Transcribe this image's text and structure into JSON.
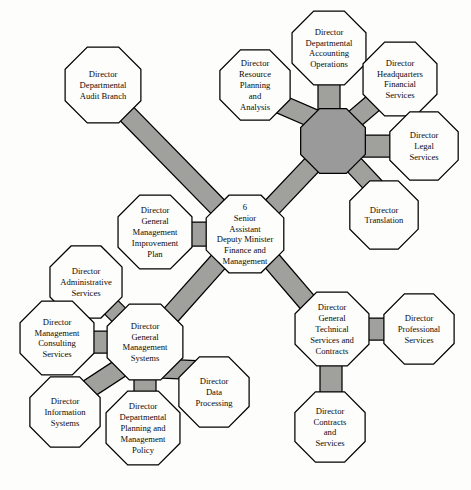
{
  "diagram": {
    "type": "organization-chart",
    "colors": {
      "node_fill": "#fdfdfb",
      "connector_fill": "#a0a09c",
      "hub_fill": "#9a9a9a",
      "outline": "#000000",
      "text": "#0b0b0b",
      "background": "#fdfdfc"
    },
    "nodes": [
      {
        "id": "center",
        "shape": "octagon",
        "filled": false,
        "number": "6",
        "lines": [
          "6",
          "Senior",
          "Assistant",
          "Deputy Minister",
          "Finance and",
          "Management"
        ],
        "cx": 245,
        "cy": 234,
        "r": 42,
        "font_size": 8.6
      },
      {
        "id": "audit-branch",
        "shape": "octagon",
        "filled": false,
        "lines": [
          "Director",
          "Departmental",
          "Audit Branch"
        ],
        "cx": 103,
        "cy": 85,
        "r": 41,
        "font_size": 8.6
      },
      {
        "id": "accounting-hub",
        "shape": "octagon",
        "filled": true,
        "lines": [],
        "cx": 333,
        "cy": 141,
        "r": 35,
        "font_size": 8.6
      },
      {
        "id": "resource-planning",
        "shape": "octagon",
        "filled": false,
        "lines": [
          "Director",
          "Resource",
          "Planning",
          "and",
          "Analysis"
        ],
        "cx": 255,
        "cy": 85,
        "r": 38,
        "font_size": 8.6
      },
      {
        "id": "accounting-operations",
        "shape": "octagon",
        "filled": false,
        "lines": [
          "Director",
          "Departmental",
          "Accounting",
          "Operations"
        ],
        "cx": 329,
        "cy": 48,
        "r": 40,
        "font_size": 8.6
      },
      {
        "id": "headquarters-financial",
        "shape": "octagon",
        "filled": false,
        "lines": [
          "Director",
          "Headquarters",
          "Financial",
          "Services"
        ],
        "cx": 400,
        "cy": 79,
        "r": 40,
        "font_size": 8.6
      },
      {
        "id": "legal-services",
        "shape": "octagon",
        "filled": false,
        "lines": [
          "Director",
          "Legal",
          "Services"
        ],
        "cx": 424,
        "cy": 146,
        "r": 37,
        "font_size": 8.6
      },
      {
        "id": "translation",
        "shape": "octagon",
        "filled": false,
        "lines": [
          "Director",
          "Translation"
        ],
        "cx": 384,
        "cy": 215,
        "r": 37,
        "font_size": 8.6
      },
      {
        "id": "gm-improvement-plan",
        "shape": "octagon",
        "filled": false,
        "lines": [
          "Director",
          "General",
          "Management",
          "Improvement",
          "Plan"
        ],
        "cx": 155,
        "cy": 232,
        "r": 40,
        "font_size": 8.6
      },
      {
        "id": "administrative-services",
        "shape": "octagon",
        "filled": false,
        "lines": [
          "Director",
          "Administrative",
          "Services"
        ],
        "cx": 86,
        "cy": 282,
        "r": 39,
        "font_size": 8.6
      },
      {
        "id": "management-consulting",
        "shape": "octagon",
        "filled": false,
        "lines": [
          "Director",
          "Management",
          "Consulting",
          "Services"
        ],
        "cx": 57,
        "cy": 338,
        "r": 40,
        "font_size": 8.6
      },
      {
        "id": "gm-systems-hub",
        "shape": "octagon",
        "filled": false,
        "lines": [
          "Director",
          "General",
          "Management",
          "Systems"
        ],
        "cx": 145,
        "cy": 342,
        "r": 41,
        "font_size": 8.6
      },
      {
        "id": "information-systems",
        "shape": "octagon",
        "filled": false,
        "lines": [
          "Director",
          "Information",
          "Systems"
        ],
        "cx": 65,
        "cy": 412,
        "r": 38,
        "font_size": 8.6
      },
      {
        "id": "departmental-planning",
        "shape": "octagon",
        "filled": false,
        "lines": [
          "Director",
          "Departmental",
          "Planning and",
          "Management",
          "Policy"
        ],
        "cx": 143,
        "cy": 428,
        "r": 40,
        "font_size": 8.6
      },
      {
        "id": "data-processing",
        "shape": "octagon",
        "filled": false,
        "lines": [
          "Director",
          "Data",
          "Processing"
        ],
        "cx": 214,
        "cy": 392,
        "r": 38,
        "font_size": 8.6
      },
      {
        "id": "technical-services-hub",
        "shape": "octagon",
        "filled": false,
        "lines": [
          "Director",
          "General",
          "Technical",
          "Services and",
          "Contracts"
        ],
        "cx": 332,
        "cy": 329,
        "r": 40,
        "font_size": 8.6
      },
      {
        "id": "professional-services",
        "shape": "octagon",
        "filled": false,
        "lines": [
          "Director",
          "Professional",
          "Services"
        ],
        "cx": 419,
        "cy": 329,
        "r": 38,
        "font_size": 8.6
      },
      {
        "id": "contracts-services",
        "shape": "octagon",
        "filled": false,
        "lines": [
          "Director",
          "Contracts",
          "and",
          "Services"
        ],
        "cx": 330,
        "cy": 427,
        "r": 38,
        "font_size": 8.6
      }
    ],
    "connectors": [
      {
        "id": "center-to-audit",
        "from": "center",
        "to": "audit-branch",
        "x1": 218,
        "y1": 207,
        "x2": 126,
        "y2": 113,
        "width": 19
      },
      {
        "id": "center-to-accounting",
        "from": "center",
        "to": "accounting-hub",
        "x1": 272,
        "y1": 207,
        "x2": 310,
        "y2": 167,
        "width": 19
      },
      {
        "id": "center-to-gmsystems",
        "from": "center",
        "to": "gm-systems-hub",
        "x1": 219,
        "y1": 261,
        "x2": 170,
        "y2": 316,
        "width": 19
      },
      {
        "id": "center-to-technical",
        "from": "center",
        "to": "technical-services-hub",
        "x1": 272,
        "y1": 261,
        "x2": 308,
        "y2": 303,
        "width": 19
      },
      {
        "id": "center-to-improvement",
        "from": "center",
        "to": "gm-improvement-plan",
        "x1": 203,
        "y1": 234,
        "x2": 185,
        "y2": 234,
        "width": 24
      },
      {
        "id": "hub-to-resource",
        "from": "accounting-hub",
        "to": "resource-planning",
        "x1": 310,
        "y1": 117,
        "x2": 280,
        "y2": 104,
        "width": 19
      },
      {
        "id": "hub-to-accounting-ops",
        "from": "accounting-hub",
        "to": "accounting-operations",
        "x1": 329,
        "y1": 106,
        "x2": 329,
        "y2": 84,
        "width": 22
      },
      {
        "id": "hub-to-headquarters",
        "from": "accounting-hub",
        "to": "headquarters-financial",
        "x1": 357,
        "y1": 117,
        "x2": 378,
        "y2": 99,
        "width": 19
      },
      {
        "id": "hub-to-legal",
        "from": "accounting-hub",
        "to": "legal-services",
        "x1": 368,
        "y1": 146,
        "x2": 393,
        "y2": 146,
        "width": 22
      },
      {
        "id": "hub-to-translation",
        "from": "accounting-hub",
        "to": "translation",
        "x1": 357,
        "y1": 168,
        "x2": 372,
        "y2": 184,
        "width": 19
      },
      {
        "id": "gms-to-administrative",
        "from": "gm-systems-hub",
        "to": "administrative-services",
        "x1": 120,
        "y1": 316,
        "x2": 104,
        "y2": 300,
        "width": 19
      },
      {
        "id": "gms-to-consulting",
        "from": "gm-systems-hub",
        "to": "management-consulting",
        "x1": 104,
        "y1": 342,
        "x2": 89,
        "y2": 342,
        "width": 22
      },
      {
        "id": "gms-to-information",
        "from": "gm-systems-hub",
        "to": "information-systems",
        "x1": 119,
        "y1": 369,
        "x2": 90,
        "y2": 388,
        "width": 19
      },
      {
        "id": "gms-to-planning",
        "from": "gm-systems-hub",
        "to": "departmental-planning",
        "x1": 145,
        "y1": 382,
        "x2": 145,
        "y2": 400,
        "width": 22
      },
      {
        "id": "gms-to-data",
        "from": "gm-systems-hub",
        "to": "data-processing",
        "x1": 172,
        "y1": 369,
        "x2": 192,
        "y2": 370,
        "width": 19
      },
      {
        "id": "tech-to-professional",
        "from": "technical-services-hub",
        "to": "professional-services",
        "x1": 371,
        "y1": 329,
        "x2": 390,
        "y2": 329,
        "width": 22
      },
      {
        "id": "tech-to-contracts",
        "from": "technical-services-hub",
        "to": "contracts-services",
        "x1": 331,
        "y1": 368,
        "x2": 331,
        "y2": 396,
        "width": 22
      }
    ]
  }
}
